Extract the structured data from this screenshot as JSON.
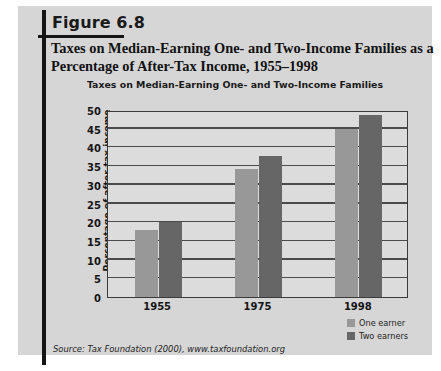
{
  "figure": {
    "label": "Figure 6.8",
    "title": "Taxes on Median-Earning One- and Two-Income Families as a Percentage of After-Tax Income, 1955–1998",
    "source": "Source: Tax Foundation (2000), www.taxfoundation.org",
    "panel_color": "#d6d6d6",
    "rule_color": "#151515"
  },
  "chart_data": {
    "type": "bar",
    "title": "Taxes on Median-Earning One- and Two-Income Families",
    "xlabel": "",
    "ylabel": "Percentage of after-tax income",
    "categories": [
      "1955",
      "1975",
      "1998"
    ],
    "series": [
      {
        "name": "One earner",
        "color": "#989898",
        "values": [
          18.0,
          34.3,
          44.8
        ]
      },
      {
        "name": "Two earners",
        "color": "#666666",
        "values": [
          20.0,
          37.7,
          48.7
        ]
      }
    ],
    "ylim": [
      0,
      50
    ],
    "yticks": [
      50,
      45,
      40,
      35,
      30,
      25,
      20,
      15,
      10,
      5,
      0
    ],
    "ytick_labels": [
      "50",
      "45",
      "40",
      "35",
      "30",
      "25",
      "20",
      "15",
      "10",
      "5",
      "0"
    ],
    "grid": true,
    "legend_position": "bottom-right",
    "plot_background": "#dcdcdc",
    "axis_color": "#3a3a3a"
  }
}
